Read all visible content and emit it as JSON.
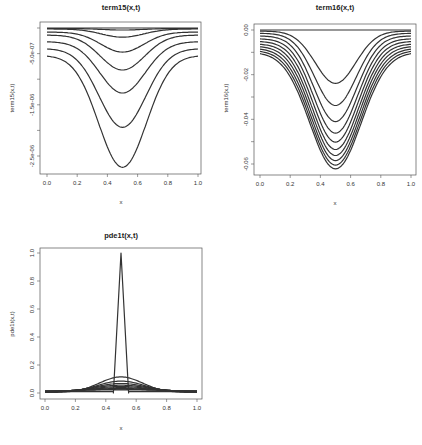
{
  "chart_data": [
    {
      "id": "term15",
      "type": "line",
      "title": "term15(x,t)",
      "xlabel": "x",
      "ylabel": "term15(x,t)",
      "xlim": [
        0,
        1
      ],
      "ylim": [
        -2.8e-06,
        1e-07
      ],
      "xticks": [
        0,
        0.2,
        0.4,
        0.6,
        0.8,
        1.0
      ],
      "xtick_labels": [
        "0.0",
        "0.2",
        "0.4",
        "0.6",
        "0.8",
        "1.0"
      ],
      "yticks": [
        0,
        -5e-07,
        -1e-06,
        -1.5e-06,
        -2e-06,
        -2.5e-06
      ],
      "ytick_labels": [
        "",
        "-5.0e-07",
        "",
        "-1.5e-06",
        "",
        "-2.5e-06"
      ],
      "grid": false,
      "shape": "gaussian-dip",
      "series": [
        {
          "name": "t1",
          "edge": 0.0,
          "min": 0.0
        },
        {
          "name": "t2",
          "edge": -1e-08,
          "min": -4e-08
        },
        {
          "name": "t3",
          "edge": -2e-08,
          "min": -1.8e-07
        },
        {
          "name": "t4",
          "edge": -8e-08,
          "min": -4.7e-07
        },
        {
          "name": "t5",
          "edge": -1.4e-07,
          "min": -8.2e-07
        },
        {
          "name": "t6",
          "edge": -2.7e-07,
          "min": -1.27e-06
        },
        {
          "name": "t7",
          "edge": -4.1e-07,
          "min": -1.94e-06
        },
        {
          "name": "t8",
          "edge": -5.5e-07,
          "min": -2.72e-06
        }
      ]
    },
    {
      "id": "term16",
      "type": "line",
      "title": "term16(x,t)",
      "xlabel": "x",
      "ylabel": "term16(x,t)",
      "xlim": [
        0,
        1
      ],
      "ylim": [
        -0.0645,
        0.0027
      ],
      "xticks": [
        0,
        0.2,
        0.4,
        0.6,
        0.8,
        1.0
      ],
      "xtick_labels": [
        "0.0",
        "0.2",
        "0.4",
        "0.6",
        "0.8",
        "1.0"
      ],
      "yticks": [
        0,
        -0.01,
        -0.02,
        -0.03,
        -0.04,
        -0.05,
        -0.06
      ],
      "ytick_labels": [
        "0.00",
        "",
        "-0.02",
        "",
        "-0.04",
        "",
        "-0.06"
      ],
      "grid": false,
      "shape": "gaussian-dip",
      "series": [
        {
          "name": "t1",
          "edge": 0.0,
          "min": 0.0
        },
        {
          "name": "t2",
          "edge": -0.0005,
          "min": -0.0239
        },
        {
          "name": "t3",
          "edge": -0.0015,
          "min": -0.0338
        },
        {
          "name": "t4",
          "edge": -0.0027,
          "min": -0.041
        },
        {
          "name": "t5",
          "edge": -0.004,
          "min": -0.0462
        },
        {
          "name": "t6",
          "edge": -0.0052,
          "min": -0.0502
        },
        {
          "name": "t7",
          "edge": -0.0064,
          "min": -0.0535
        },
        {
          "name": "t8",
          "edge": -0.0075,
          "min": -0.0562
        },
        {
          "name": "t9",
          "edge": -0.0086,
          "min": -0.0585
        },
        {
          "name": "t10",
          "edge": -0.0096,
          "min": -0.0605
        },
        {
          "name": "t11",
          "edge": -0.0106,
          "min": -0.0622
        }
      ]
    },
    {
      "id": "pde1t",
      "type": "line",
      "title": "pde1t(x,t)",
      "xlabel": "x",
      "ylabel": "pde1t(x,t)",
      "xlim": [
        0,
        1
      ],
      "ylim": [
        -0.04,
        1.04
      ],
      "xticks": [
        0,
        0.2,
        0.4,
        0.6,
        0.8,
        1.0
      ],
      "xtick_labels": [
        "0.0",
        "0.2",
        "0.4",
        "0.6",
        "0.8",
        "1.0"
      ],
      "yticks": [
        0,
        0.2,
        0.4,
        0.6,
        0.8,
        1.0
      ],
      "ytick_labels": [
        "0.0",
        "0.2",
        "0.4",
        "0.6",
        "0.8",
        "1.0"
      ],
      "grid": false,
      "initial_condition": {
        "x": [
          0,
          0.45,
          0.45,
          0.5,
          0.55,
          0.55,
          1.0
        ],
        "y": [
          0.01,
          0.01,
          0.0,
          1.0,
          0.0,
          0.01,
          0.01
        ]
      },
      "shape": "gaussian-bump",
      "series": [
        {
          "name": "t1",
          "edge": 0.0,
          "peak": 1.0
        },
        {
          "name": "t2",
          "edge": 0.004,
          "peak": 0.115
        },
        {
          "name": "t3",
          "edge": 0.006,
          "peak": 0.085
        },
        {
          "name": "t4",
          "edge": 0.008,
          "peak": 0.068
        },
        {
          "name": "t5",
          "edge": 0.01,
          "peak": 0.056
        },
        {
          "name": "t6",
          "edge": 0.011,
          "peak": 0.046
        },
        {
          "name": "t7",
          "edge": 0.012,
          "peak": 0.038
        },
        {
          "name": "t8",
          "edge": 0.013,
          "peak": 0.032
        },
        {
          "name": "t9",
          "edge": 0.014,
          "peak": 0.027
        },
        {
          "name": "t10",
          "edge": 0.015,
          "peak": 0.023
        }
      ]
    }
  ],
  "panels": [
    {
      "box": [
        40,
        22,
        201,
        174
      ],
      "xmap": [
        47,
        198
      ],
      "ymap_ref": [
        [
          0,
          28
        ],
        [
          -2.5e-06,
          156
        ]
      ]
    },
    {
      "box": [
        254,
        24,
        416,
        175
      ],
      "xmap": [
        260,
        411
      ],
      "ymap_ref": [
        [
          0,
          30
        ],
        [
          -0.06,
          164
        ]
      ]
    },
    {
      "box": [
        40,
        248,
        202,
        399
      ],
      "xmap": [
        45,
        197
      ],
      "ymap_ref": [
        [
          0,
          393
        ],
        [
          1.0,
          253
        ]
      ]
    }
  ]
}
